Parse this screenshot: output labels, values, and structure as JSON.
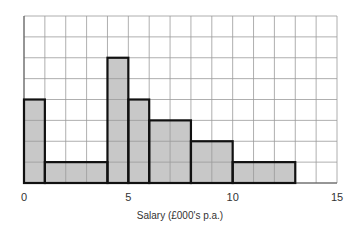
{
  "chart_data": {
    "type": "bar",
    "subtype": "histogram",
    "title": "",
    "xlabel": "Salary (£000's p.a.)",
    "ylabel": "",
    "xlim": [
      0,
      15
    ],
    "ylim": [
      0,
      8
    ],
    "grid": true,
    "legend": null,
    "x_ticks": [
      0,
      5,
      10,
      15
    ],
    "x_tick_labels": [
      "0",
      "5",
      "10",
      "15"
    ],
    "bins": [
      {
        "from": 0,
        "to": 1,
        "height": 4
      },
      {
        "from": 1,
        "to": 4,
        "height": 1
      },
      {
        "from": 4,
        "to": 5,
        "height": 6
      },
      {
        "from": 5,
        "to": 6,
        "height": 4
      },
      {
        "from": 6,
        "to": 8,
        "height": 3
      },
      {
        "from": 8,
        "to": 10,
        "height": 2
      },
      {
        "from": 10,
        "to": 13,
        "height": 1
      }
    ],
    "categories": [
      "0-1",
      "1-4",
      "4-5",
      "5-6",
      "6-8",
      "8-10",
      "10-13"
    ],
    "values": [
      4,
      1,
      6,
      4,
      3,
      2,
      1
    ],
    "colors": {
      "bar_fill": "#c8c8c8",
      "bar_edge": "#111111",
      "grid": "#9a9a9a"
    }
  }
}
